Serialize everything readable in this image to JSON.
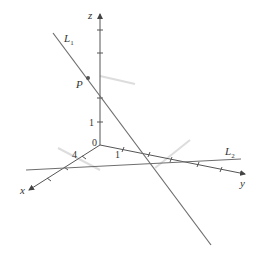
{
  "figure": {
    "type": "3d-coordinate-lines",
    "axes": {
      "x": {
        "label": "x",
        "tick_label": "4"
      },
      "y": {
        "label": "y",
        "tick_label": "1"
      },
      "z": {
        "label": "z",
        "tick_label": "1"
      },
      "origin_label": "0"
    },
    "lines": [
      {
        "name": "L",
        "subscript": "1"
      },
      {
        "name": "L",
        "subscript": "2"
      }
    ],
    "point": {
      "label": "P"
    },
    "colors": {
      "line": "#6e6e6e",
      "axis": "#555555",
      "shadow": "#d8d8d8",
      "text": "#333333"
    }
  }
}
